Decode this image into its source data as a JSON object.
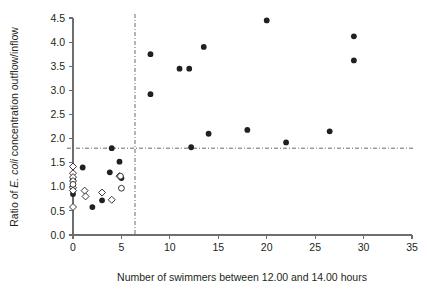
{
  "chart_data": {
    "type": "scatter",
    "title": "",
    "xlabel": "Number of swimmers between 12.00 and 14.00 hours",
    "ylabel": "Ratio of E. coli concentration outflow/inflow",
    "ylabel_italic_part": "E. coli",
    "xlim": [
      0,
      35
    ],
    "ylim": [
      0.0,
      4.5
    ],
    "xticks": [
      0,
      5,
      10,
      15,
      20,
      25,
      30,
      35
    ],
    "xticklabels": [
      "0",
      "5",
      "10",
      "15",
      "20",
      "25",
      "30",
      "35"
    ],
    "yticks": [
      0.0,
      0.5,
      1.0,
      1.5,
      2.0,
      2.5,
      3.0,
      3.5,
      4.0,
      4.5
    ],
    "yticklabels": [
      "0.0",
      "0.5",
      "1.0",
      "1.5",
      "2.0",
      "2.5",
      "3.0",
      "3.5",
      "4.0",
      "4.5"
    ],
    "grid": false,
    "legend": "none",
    "reference_lines": [
      {
        "name": "horizontal-threshold",
        "orientation": "horizontal",
        "value": 1.8,
        "style": "dash-dot"
      },
      {
        "name": "vertical-threshold",
        "orientation": "vertical",
        "value": 6.4,
        "style": "dash-dot"
      }
    ],
    "series": [
      {
        "name": "filled-circles",
        "marker": "filled-circle",
        "color": "#231f20",
        "points": [
          [
            0.0,
            0.85
          ],
          [
            0.0,
            1.15
          ],
          [
            1.0,
            1.4
          ],
          [
            2.0,
            0.58
          ],
          [
            3.0,
            0.72
          ],
          [
            3.8,
            1.3
          ],
          [
            4.0,
            1.8
          ],
          [
            4.8,
            1.52
          ],
          [
            5.0,
            1.18
          ],
          [
            8.0,
            2.92
          ],
          [
            8.0,
            3.75
          ],
          [
            11.0,
            3.45
          ],
          [
            12.0,
            3.45
          ],
          [
            12.2,
            1.82
          ],
          [
            13.5,
            3.9
          ],
          [
            14.0,
            2.1
          ],
          [
            18.0,
            2.18
          ],
          [
            20.0,
            4.45
          ],
          [
            22.0,
            1.92
          ],
          [
            26.5,
            2.15
          ],
          [
            29.0,
            3.62
          ],
          [
            29.0,
            4.12
          ]
        ]
      },
      {
        "name": "open-diamonds",
        "marker": "open-diamond",
        "color": "#ffffff",
        "points": [
          [
            0.0,
            1.42
          ],
          [
            0.0,
            1.28
          ],
          [
            0.0,
            1.2
          ],
          [
            0.0,
            1.12
          ],
          [
            0.0,
            0.98
          ],
          [
            0.0,
            0.92
          ],
          [
            0.0,
            0.58
          ],
          [
            1.2,
            0.92
          ],
          [
            1.3,
            0.8
          ],
          [
            3.0,
            0.88
          ],
          [
            4.0,
            0.73
          ],
          [
            4.8,
            1.22
          ]
        ]
      },
      {
        "name": "open-circles",
        "marker": "open-circle",
        "color": "#ffffff",
        "points": [
          [
            0.0,
            1.05
          ],
          [
            5.0,
            0.97
          ],
          [
            4.9,
            1.22
          ]
        ]
      }
    ]
  }
}
